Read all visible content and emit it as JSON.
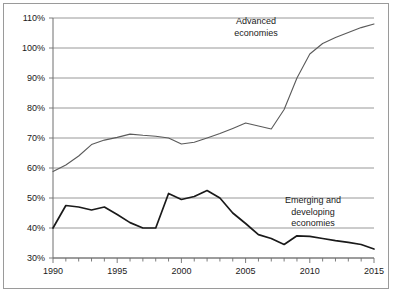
{
  "figure": {
    "background_color": "#ffffff",
    "frame_color": "#9a9a9a",
    "gridline_color": "#8c8c8c",
    "axis_color": "#6e6e6e"
  },
  "chart_data": {
    "type": "line",
    "title": "",
    "subtitle": "",
    "xlabel": "",
    "ylabel": "",
    "xlim": [
      1990,
      2015
    ],
    "ylim": [
      30,
      110
    ],
    "grid": true,
    "grid_axis": "y",
    "legend_position": "inline-annotation",
    "x_tick_labels": [
      "1990",
      "1995",
      "2000",
      "2005",
      "2010",
      "2015"
    ],
    "x_tick_values": [
      1990,
      1995,
      2000,
      2005,
      2010,
      2015
    ],
    "x_minor_tick_values": [
      1990,
      1991,
      1992,
      1993,
      1994,
      1995,
      1996,
      1997,
      1998,
      1999,
      2000,
      2001,
      2002,
      2003,
      2004,
      2005,
      2006,
      2007,
      2008,
      2009,
      2010,
      2011,
      2012,
      2013,
      2014,
      2015
    ],
    "y_tick_labels": [
      "30%",
      "40%",
      "50%",
      "60%",
      "70%",
      "80%",
      "90%",
      "100%",
      "110%"
    ],
    "y_tick_values": [
      30,
      40,
      50,
      60,
      70,
      80,
      90,
      100,
      110
    ],
    "x": [
      1990,
      1991,
      1992,
      1993,
      1994,
      1995,
      1996,
      1997,
      1998,
      1999,
      2000,
      2001,
      2002,
      2003,
      2004,
      2005,
      2006,
      2007,
      2008,
      2009,
      2010,
      2011,
      2012,
      2013,
      2014,
      2015
    ],
    "series": [
      {
        "name": "Advanced economies",
        "label_lines": [
          "Advanced",
          "economies"
        ],
        "color": "#5a5a5a",
        "line_width": 1.1,
        "values": [
          58.8,
          61.0,
          64.0,
          67.8,
          69.3,
          70.2,
          71.3,
          70.9,
          70.6,
          70.0,
          68.0,
          68.6,
          70.0,
          71.5,
          73.2,
          75.0,
          74.0,
          73.0,
          79.5,
          90.0,
          98.0,
          101.5,
          103.5,
          105.2,
          106.8,
          108.0
        ]
      },
      {
        "name": "Emerging and developing economies",
        "label_lines": [
          "Emerging and",
          "developing",
          "economies"
        ],
        "color": "#1a1a1a",
        "line_width": 1.7,
        "values": [
          40.0,
          47.5,
          47.0,
          46.0,
          47.0,
          44.5,
          41.8,
          40.0,
          40.0,
          51.5,
          49.5,
          50.5,
          52.5,
          50.0,
          45.0,
          41.5,
          37.8,
          36.5,
          34.5,
          37.4,
          37.2,
          36.5,
          35.8,
          35.2,
          34.5,
          33.0
        ]
      }
    ],
    "annotations": [
      {
        "name": "advanced-economies-label",
        "text_lines": [
          "Advanced",
          "economies"
        ],
        "x_px": 256,
        "y_px": 24
      },
      {
        "name": "emerging-economies-label",
        "text_lines": [
          "Emerging and",
          "developing",
          "economies"
        ],
        "x_px": 313,
        "y_px": 203
      }
    ]
  }
}
